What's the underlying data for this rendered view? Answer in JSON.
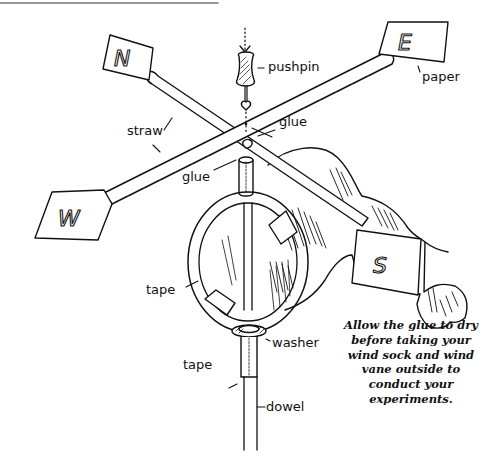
{
  "diagram": {
    "top_rule": true,
    "flags": {
      "north": "N",
      "east": "E",
      "west": "W",
      "south": "S"
    },
    "labels": {
      "pushpin": "pushpin",
      "paper": "paper",
      "straw": "straw",
      "glue_top": "glue",
      "glue_left": "glue",
      "tape_ring": "tape",
      "washer": "washer",
      "tape_dowel": "tape",
      "dowel": "dowel"
    },
    "note": "Allow the glue to dry before taking your wind sock and wind vane outside to conduct your experiments.",
    "colors": {
      "ink": "#111111",
      "background": "#ffffff",
      "rule": "#777777"
    }
  }
}
